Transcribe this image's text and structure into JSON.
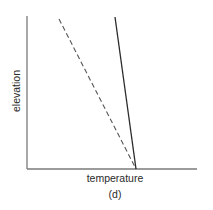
{
  "diagram": {
    "panel_label": "(d)",
    "x_axis_label": "temperature",
    "y_axis_label": "elevation",
    "colors": {
      "axis": "#7a7a7a",
      "solid_line": "#2a2a2a",
      "dashed_line": "#555555",
      "text": "#2a2a2a",
      "background": "#ffffff"
    },
    "axes": {
      "origin": [
        27,
        169
      ],
      "y_axis_top": [
        27,
        16
      ],
      "x_axis_right": [
        197,
        169
      ]
    },
    "lines": [
      {
        "name": "solid-profile",
        "style": "solid",
        "from": [
          115,
          17
        ],
        "to": [
          136,
          169
        ]
      },
      {
        "name": "dashed-profile",
        "style": "dashed",
        "from": [
          59,
          19
        ],
        "to": [
          136,
          169
        ]
      }
    ]
  }
}
